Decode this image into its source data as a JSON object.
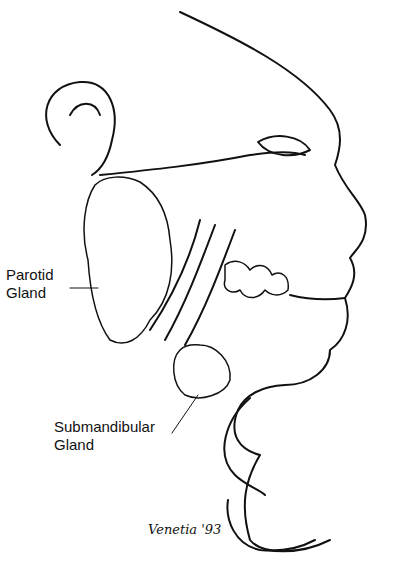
{
  "labels": {
    "parotid": [
      "Parotid",
      "Gland"
    ],
    "submandibular": [
      "Submandibular",
      "Gland"
    ]
  },
  "signature": "Venetia '93",
  "colors": {
    "ink": "#111111",
    "background": "#ffffff"
  }
}
